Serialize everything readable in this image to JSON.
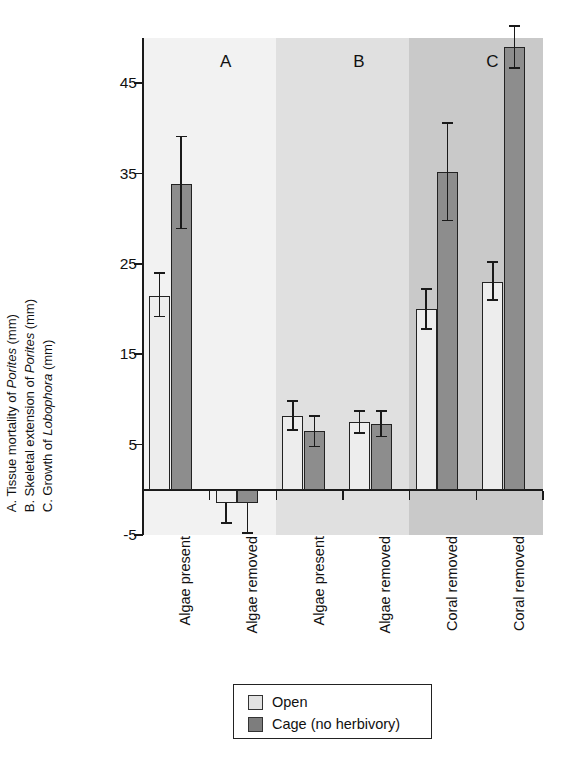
{
  "chart_data": {
    "type": "bar",
    "title": "",
    "subtitle": "",
    "xlabel": "",
    "ylabel_lines": [
      "A. Tissue mortality of Porites (mm)",
      "B. Skeletal extension of Porites (mm)",
      "C. Growth of Lobophora (mm)"
    ],
    "ylim": [
      -5,
      50
    ],
    "yticks": [
      45,
      35,
      25,
      15,
      5,
      -5
    ],
    "ytick_labels": [
      "45",
      "35",
      "25",
      "15",
      "5",
      "-5"
    ],
    "grid": false,
    "legend_position": "below-axes",
    "panels": [
      {
        "letter": "A",
        "axis_label": "A. Tissue mortality of Porites (mm)",
        "background": "#f2f2f2",
        "categories": [
          "Algae present",
          "Algae removed"
        ],
        "series": [
          {
            "name": "Open",
            "color": "#ededed",
            "values": [
              21.5,
              -1.5
            ],
            "err_upper": [
              2.5,
              0.0
            ],
            "err_lower": [
              2.3,
              2.2
            ]
          },
          {
            "name": "Cage (no herbivory)",
            "color": "#8d8d8d",
            "values": [
              33.8,
              -1.5
            ],
            "err_upper": [
              5.3,
              0.0
            ],
            "err_lower": [
              4.9,
              3.3
            ]
          }
        ]
      },
      {
        "letter": "B",
        "axis_label": "B. Skeletal extension of Porites (mm)",
        "background": "#e0e0e0",
        "categories": [
          "Algae present",
          "Algae removed"
        ],
        "series": [
          {
            "name": "Open",
            "color": "#ededed",
            "values": [
              8.2,
              7.5
            ],
            "err_upper": [
              1.6,
              1.2
            ],
            "err_lower": [
              1.6,
              1.2
            ]
          },
          {
            "name": "Cage (no herbivory)",
            "color": "#8d8d8d",
            "values": [
              6.5,
              7.3
            ],
            "err_upper": [
              1.7,
              1.4
            ],
            "err_lower": [
              1.7,
              1.4
            ]
          }
        ]
      },
      {
        "letter": "C",
        "axis_label": "C. Growth of Lobophora (mm)",
        "background": "#c9c9c9",
        "categories": [
          "Coral removed",
          "Coral removed"
        ],
        "series": [
          {
            "name": "Open",
            "color": "#ededed",
            "values": [
              20.0,
              23.0
            ],
            "err_upper": [
              2.2,
              2.2
            ],
            "err_lower": [
              2.2,
              2.0
            ]
          },
          {
            "name": "Cage (no herbivory)",
            "color": "#8d8d8d",
            "values": [
              35.2,
              49.0
            ],
            "err_upper": [
              5.4,
              2.3
            ],
            "err_lower": [
              5.4,
              2.3
            ]
          }
        ]
      }
    ],
    "x_categories_flat": [
      "Algae present",
      "Algae removed",
      "Algae present",
      "Algae removed",
      "Coral removed",
      "Coral removed"
    ],
    "legend": [
      {
        "label": "Open",
        "color": "#e2e2e2"
      },
      {
        "label": "Cage (no herbivory)",
        "color": "#7d7d7d"
      }
    ]
  },
  "ylabels": {
    "line_a_prefix": "A. Tissue mortality of ",
    "line_a_italic": "Porites",
    "line_a_suffix": " (mm)",
    "line_b_prefix": "B. Skeletal extension of ",
    "line_b_italic": "Porites",
    "line_b_suffix": " (mm)",
    "line_c_prefix": "C. Growth of ",
    "line_c_italic": "Lobophora",
    "line_c_suffix": " (mm)"
  },
  "panel_letters": [
    "A",
    "B",
    "C"
  ],
  "ytick_labels": [
    "45",
    "35",
    "25",
    "15",
    "5",
    "-5"
  ],
  "legend": {
    "open_label": "Open",
    "cage_label": "Cage (no herbivory)"
  }
}
